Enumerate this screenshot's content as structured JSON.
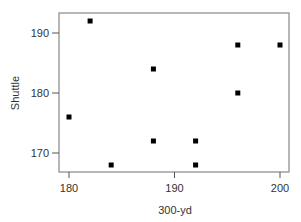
{
  "chart_data": {
    "type": "scatter",
    "title": "",
    "xlabel": "300-yd",
    "ylabel": "Shuttle",
    "xlim": [
      179,
      201
    ],
    "ylim": [
      166.5,
      193
    ],
    "xticks": [
      180,
      190,
      200
    ],
    "yticks": [
      170,
      180,
      190
    ],
    "grid": false,
    "legend": null,
    "marker": "square",
    "marker_color": "#000000",
    "axis_color": "#888888",
    "points": [
      {
        "x": 182,
        "y": 192
      },
      {
        "x": 180,
        "y": 176
      },
      {
        "x": 184,
        "y": 168
      },
      {
        "x": 188,
        "y": 184
      },
      {
        "x": 188,
        "y": 172
      },
      {
        "x": 192,
        "y": 172
      },
      {
        "x": 192,
        "y": 168
      },
      {
        "x": 196,
        "y": 188
      },
      {
        "x": 196,
        "y": 180
      },
      {
        "x": 200,
        "y": 188
      }
    ]
  }
}
